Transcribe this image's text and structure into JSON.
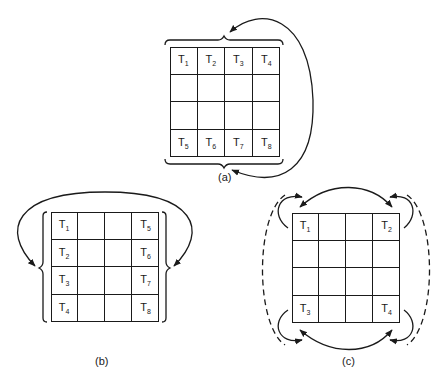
{
  "figures": [
    {
      "id": "a",
      "caption": "(a)",
      "grid": {
        "rows": 4,
        "cols": 4
      },
      "labels": [
        {
          "row": 0,
          "col": 0,
          "text": "T",
          "sub": "1"
        },
        {
          "row": 0,
          "col": 1,
          "text": "T",
          "sub": "2"
        },
        {
          "row": 0,
          "col": 2,
          "text": "T",
          "sub": "3"
        },
        {
          "row": 0,
          "col": 3,
          "text": "T",
          "sub": "4"
        },
        {
          "row": 3,
          "col": 0,
          "text": "T",
          "sub": "5"
        },
        {
          "row": 3,
          "col": 1,
          "text": "T",
          "sub": "6"
        },
        {
          "row": 3,
          "col": 2,
          "text": "T",
          "sub": "7"
        },
        {
          "row": 3,
          "col": 3,
          "text": "T",
          "sub": "8"
        }
      ]
    },
    {
      "id": "b",
      "caption": "(b)",
      "grid": {
        "rows": 4,
        "cols": 4
      },
      "labels": [
        {
          "row": 0,
          "col": 0,
          "text": "T",
          "sub": "1"
        },
        {
          "row": 1,
          "col": 0,
          "text": "T",
          "sub": "2"
        },
        {
          "row": 2,
          "col": 0,
          "text": "T",
          "sub": "3"
        },
        {
          "row": 3,
          "col": 0,
          "text": "T",
          "sub": "4"
        },
        {
          "row": 0,
          "col": 3,
          "text": "T",
          "sub": "5"
        },
        {
          "row": 1,
          "col": 3,
          "text": "T",
          "sub": "6"
        },
        {
          "row": 2,
          "col": 3,
          "text": "T",
          "sub": "7"
        },
        {
          "row": 3,
          "col": 3,
          "text": "T",
          "sub": "8"
        }
      ]
    },
    {
      "id": "c",
      "caption": "(c)",
      "grid": {
        "rows": 4,
        "cols": 4
      },
      "labels": [
        {
          "row": 0,
          "col": 0,
          "text": "T",
          "sub": "1"
        },
        {
          "row": 0,
          "col": 3,
          "text": "T",
          "sub": "2"
        },
        {
          "row": 3,
          "col": 0,
          "text": "T",
          "sub": "3"
        },
        {
          "row": 3,
          "col": 3,
          "text": "T",
          "sub": "4"
        }
      ]
    }
  ],
  "colors": {
    "line": "#1a1a1a",
    "background": "#ffffff"
  }
}
